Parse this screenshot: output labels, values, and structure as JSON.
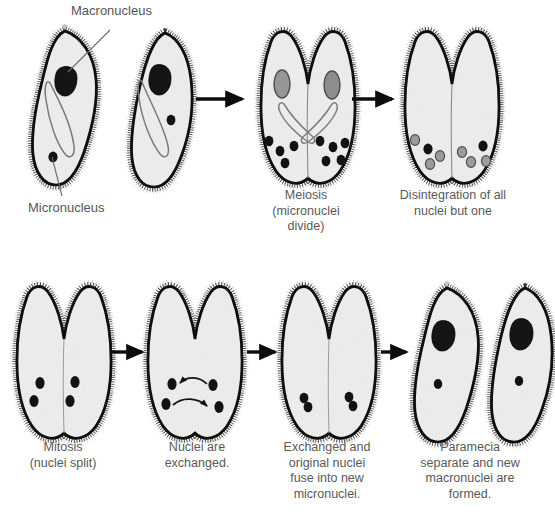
{
  "figure": {
    "background_color": "#ffffff",
    "text_color": "#565656",
    "outline_color": "#111111",
    "cytoplasm_color": "#f4f4f2",
    "macronucleus_dark_color": "#1a1a1a",
    "macronucleus_gray_color": "#8f8f8f",
    "micronucleus_dark_color": "#141414",
    "micronucleus_gray_color": "#9a9a9a"
  },
  "annotations": [
    {
      "name": "macronucleus",
      "label": "Macronucleus"
    },
    {
      "name": "micronucleus",
      "label": "Micronucleus"
    }
  ],
  "stages": [
    {
      "id": "stage-1",
      "row": 1,
      "caption": "",
      "description": "Two separate paramecia come together",
      "cells": 2,
      "macronuclei": 2,
      "micronuclei": 2
    },
    {
      "id": "stage-2",
      "row": 1,
      "caption": "Meiosis\n(micronuclei\ndivide)",
      "description": "Conjoined pair, micronuclei undergo meiosis",
      "cells": 2,
      "macronuclei": 2,
      "micronuclei": 8
    },
    {
      "id": "stage-3",
      "row": 1,
      "caption": "Disintegration of all\nnuclei but one",
      "description": "Macronuclei gone, most micronuclei disintegrating",
      "cells": 2,
      "macronuclei": 0,
      "micronuclei": 8
    },
    {
      "id": "stage-4",
      "row": 2,
      "caption": "Mitosis\n(nuclei split)",
      "description": "Surviving micronucleus divides by mitosis",
      "cells": 2,
      "macronuclei": 0,
      "micronuclei": 4
    },
    {
      "id": "stage-5",
      "row": 2,
      "caption": "Nuclei are\nexchanged.",
      "description": "Micronuclei swapped between partners",
      "cells": 2,
      "macronuclei": 0,
      "micronuclei": 4
    },
    {
      "id": "stage-6",
      "row": 2,
      "caption": "Exchanged and\noriginal nuclei\nfuse into new\nmicronuclei.",
      "description": "Fused figure-eight micronuclei",
      "cells": 2,
      "macronuclei": 0,
      "micronuclei": 2
    },
    {
      "id": "stage-7",
      "row": 2,
      "caption": "Paramecia\nseparate and new\nmacronuclei are\nformed.",
      "description": "Two separate paramecia with new macronuclei",
      "cells": 2,
      "macronuclei": 2,
      "micronuclei": 2
    }
  ],
  "arrows": [
    {
      "name": "arrow-stage1-to-stage2",
      "row": 1
    },
    {
      "name": "arrow-stage2-to-stage3",
      "row": 1
    },
    {
      "name": "arrow-stage4-to-stage5",
      "row": 2
    },
    {
      "name": "arrow-stage5-to-stage6",
      "row": 2
    },
    {
      "name": "arrow-stage6-to-stage7",
      "row": 2
    }
  ],
  "exchange_arrows": {
    "name": "nuclei-exchange-arrows",
    "count": 2,
    "description": "Two curved arrows showing reciprocal micronucleus transfer"
  }
}
